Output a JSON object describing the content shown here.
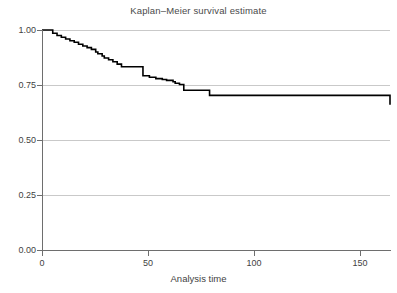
{
  "chart_data": {
    "type": "line",
    "subtype": "kaplan-meier-step",
    "title": "Kaplan–Meier survival estimate",
    "xlabel": "Analysis time",
    "ylabel": "",
    "xlim": [
      0,
      162
    ],
    "ylim": [
      0,
      1
    ],
    "xticks": [
      0,
      50,
      100,
      150
    ],
    "xtick_labels": [
      "0",
      "50",
      "100",
      "150"
    ],
    "yticks": [
      0.0,
      0.25,
      0.5,
      0.75,
      1.0
    ],
    "ytick_labels": [
      "0.00",
      "0.25",
      "0.50",
      "0.75",
      "1.00"
    ],
    "grid": "horizontal",
    "legend": "none",
    "line_color": "#000000",
    "grid_color": "#c9c9c9",
    "axis_color": "#6e6e6e",
    "text_color": "#3f3f3f",
    "series": [
      {
        "name": "Survival probability",
        "step_type": "post",
        "x": [
          0,
          2,
          5,
          7,
          9,
          11,
          13,
          15,
          17,
          19,
          21,
          23,
          25,
          26,
          28,
          29,
          31,
          33,
          35,
          37,
          46,
          47,
          50,
          53,
          56,
          58,
          61,
          62,
          64,
          66,
          75,
          78,
          162
        ],
        "y": [
          1.0,
          1.0,
          0.985,
          0.975,
          0.967,
          0.959,
          0.951,
          0.944,
          0.935,
          0.927,
          0.92,
          0.912,
          0.9,
          0.892,
          0.882,
          0.873,
          0.865,
          0.856,
          0.845,
          0.833,
          0.833,
          0.792,
          0.785,
          0.779,
          0.775,
          0.771,
          0.765,
          0.758,
          0.752,
          0.726,
          0.726,
          0.703,
          0.66
        ],
        "final_value": 0.66
      }
    ]
  }
}
